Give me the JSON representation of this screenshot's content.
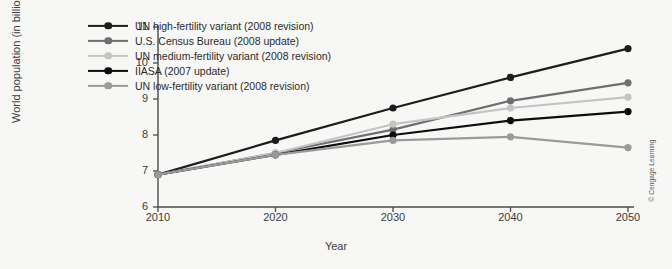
{
  "figure": {
    "copyright": "© Cengage Learning"
  },
  "chart_data": {
    "type": "line",
    "title": "",
    "xlabel": "Year",
    "ylabel": "World population (in billions)",
    "x": [
      2010,
      2020,
      2030,
      2040,
      2050
    ],
    "xticklabels": [
      "2010",
      "2020",
      "2030",
      "2040",
      "2050"
    ],
    "yticklabels": [
      "6",
      "7",
      "8",
      "9",
      "10",
      "11"
    ],
    "yticks": [
      6,
      7,
      8,
      9,
      10,
      11
    ],
    "xlim": [
      2010,
      2050
    ],
    "ylim": [
      6,
      11
    ],
    "grid": false,
    "legend_position": "upper-left-inside",
    "series": [
      {
        "name": "UN high-fertility variant (2008 revision)",
        "color": "#1d1d1d",
        "values": [
          6.9,
          7.85,
          8.75,
          9.6,
          10.4
        ]
      },
      {
        "name": "U.S. Census Bureau (2008 update)",
        "color": "#6f6f6f",
        "values": [
          6.9,
          7.5,
          8.15,
          8.95,
          9.45
        ]
      },
      {
        "name": "UN medium-fertility variant (2008 revision)",
        "color": "#c4c4c4",
        "values": [
          6.9,
          7.5,
          8.3,
          8.75,
          9.05
        ]
      },
      {
        "name": "IIASA (2007 update)",
        "color": "#0d0d0d",
        "values": [
          6.9,
          7.45,
          8.0,
          8.4,
          8.65
        ]
      },
      {
        "name": "UN low-fertility variant (2008 revision)",
        "color": "#9a9a9a",
        "values": [
          6.9,
          7.45,
          7.85,
          7.95,
          7.65
        ]
      }
    ]
  }
}
